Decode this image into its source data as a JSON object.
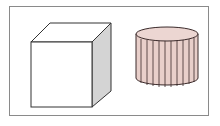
{
  "diagram": {
    "shapes": [
      {
        "name": "cube",
        "fill_front": "#ffffff",
        "fill_top": "#ffffff",
        "fill_side": "#d4d4d4",
        "stroke": "#333333"
      },
      {
        "name": "cylinder",
        "fill": "#e8cfca",
        "top_fill": "#ecd6d2",
        "stroke": "#3a2a2a",
        "vertical_lines": 10
      }
    ],
    "frame_color": "#8a8a8a"
  }
}
